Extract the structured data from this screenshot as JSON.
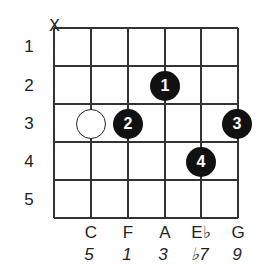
{
  "chord": {
    "fret_numbers": [
      "1",
      "2",
      "3",
      "4",
      "5"
    ],
    "mute_marker": "X",
    "muted_string": 1,
    "strings": [
      {
        "note": "",
        "interval": ""
      },
      {
        "note": "C",
        "interval": "5"
      },
      {
        "note": "F",
        "interval": "1"
      },
      {
        "note": "A",
        "interval": "3"
      },
      {
        "note": "E♭",
        "interval": "♭7"
      },
      {
        "note": "G",
        "interval": "9"
      }
    ],
    "fingerings": [
      {
        "string": 4,
        "fret": 2,
        "finger": "1"
      },
      {
        "string": 3,
        "fret": 3,
        "finger": "2"
      },
      {
        "string": 6,
        "fret": 3,
        "finger": "3"
      },
      {
        "string": 5,
        "fret": 4,
        "finger": "4"
      }
    ],
    "open_markers": [
      {
        "string": 2,
        "fret": 3
      }
    ],
    "colors": {
      "grid": "#333333",
      "dot_fill": "#111111",
      "dot_text": "#ffffff",
      "open_dot_fill": "#ffffff"
    }
  }
}
